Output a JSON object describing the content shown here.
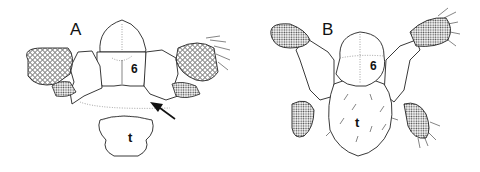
{
  "figure": {
    "panels": [
      {
        "id": "A",
        "label": "A",
        "segment_label": "6",
        "tergite_label": "t",
        "has_arrow": true
      },
      {
        "id": "B",
        "label": "B",
        "segment_label": "6",
        "tergite_label": "t",
        "has_arrow": false
      }
    ],
    "colors": {
      "line": "#222222",
      "background": "#ffffff",
      "dotted": "#888888"
    }
  }
}
